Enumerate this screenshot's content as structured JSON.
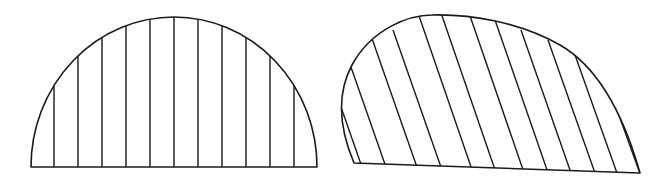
{
  "figure": {
    "shapes": [
      {
        "name": "left-semi-ellipse",
        "description": "semi-elliptical region with vertical hatching",
        "hatch_direction": "vertical",
        "hatch_count": 11,
        "stroke_color": "#1a1a1a",
        "fill_color": "#ffffff"
      },
      {
        "name": "right-skewed-dome",
        "description": "skewed dome region with oblique hatching",
        "hatch_direction": "oblique",
        "hatch_count": 12,
        "stroke_color": "#1a1a1a",
        "fill_color": "#ffffff"
      }
    ]
  }
}
